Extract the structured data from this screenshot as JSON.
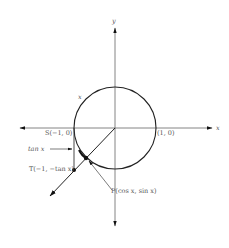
{
  "diagram": {
    "axes": {
      "x_label": "x",
      "y_label": "y"
    },
    "circle": {
      "center": [
        115,
        128
      ],
      "radius": 41,
      "arc_label": "x"
    },
    "points": {
      "S": {
        "label": "S(−1, 0)",
        "pos": [
          74,
          128
        ]
      },
      "one_zero": {
        "label": "(1, 0)",
        "pos": [
          155,
          128
        ]
      },
      "T": {
        "label": "T(−1, −tan x)",
        "pos": [
          74,
          170
        ]
      },
      "P": {
        "label": "P(cos x, sin x)",
        "pos": [
          86,
          158
        ]
      }
    },
    "annotations": {
      "tan_label": "tan x"
    },
    "colors": {
      "stroke": "#222222",
      "axis": "#666666",
      "text": "#555555"
    }
  }
}
